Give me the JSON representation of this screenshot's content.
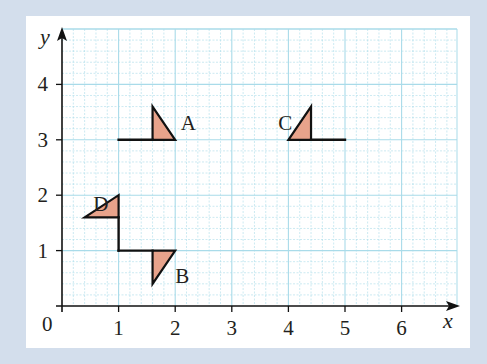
{
  "figure": {
    "background_color": "#d3deec",
    "panel_color": "#ffffff",
    "grid_color": "#a9dbe9",
    "shape_fill": "#e8a38b",
    "stroke_color": "#111111"
  },
  "axes": {
    "x_label": "x",
    "y_label": "y",
    "origin_label": "0",
    "x_ticks": [
      "1",
      "2",
      "3",
      "4",
      "5",
      "6"
    ],
    "y_ticks": [
      "1",
      "2",
      "3",
      "4"
    ],
    "x_range": [
      0,
      7
    ],
    "y_range": [
      0,
      5
    ],
    "minor_divisions_per_unit": 5
  },
  "shapes": [
    {
      "label": "A",
      "triangle": [
        [
          1.6,
          3
        ],
        [
          1.6,
          3.6
        ],
        [
          2,
          3
        ]
      ],
      "stem": [
        [
          1,
          3
        ],
        [
          1.6,
          3
        ]
      ],
      "label_pos": [
        2.1,
        3.3
      ]
    },
    {
      "label": "B",
      "triangle": [
        [
          1.6,
          1
        ],
        [
          2,
          1
        ],
        [
          1.6,
          0.4
        ]
      ],
      "stem": [
        [
          1,
          1
        ],
        [
          1.6,
          1
        ]
      ],
      "label_pos": [
        2.0,
        0.55
      ]
    },
    {
      "label": "C",
      "triangle": [
        [
          4,
          3
        ],
        [
          4.4,
          3.6
        ],
        [
          4.4,
          3
        ]
      ],
      "stem": [
        [
          4.4,
          3
        ],
        [
          5,
          3
        ]
      ],
      "label_pos": [
        3.82,
        3.3
      ]
    },
    {
      "label": "D",
      "triangle": [
        [
          0.4,
          1.6
        ],
        [
          1,
          2
        ],
        [
          1,
          1.6
        ]
      ],
      "stem": [
        [
          1,
          1.6
        ],
        [
          1,
          1
        ]
      ],
      "label_pos": [
        0.55,
        1.85
      ]
    }
  ]
}
